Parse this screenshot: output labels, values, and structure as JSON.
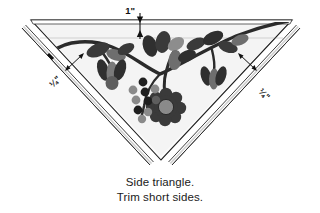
{
  "figure": {
    "name": "side-triangle-applique-diagram",
    "caption_lines": [
      "Side triangle.",
      "Trim short sides."
    ],
    "dimensions": {
      "top_label": "1\"",
      "left_label": "¼\"",
      "right_label": "¼\""
    },
    "colors": {
      "outline": "#1a1a1a",
      "patch_fill": "#f7f7f7",
      "patch_fill_shadow": "#e8e8e8",
      "motif_dark": "#2b2b2b",
      "motif_mid": "#6e6e6e",
      "motif_light": "#9a9a9a",
      "background": "#ffffff",
      "trim_line": "#333333"
    },
    "elements": {
      "triangle_name": "side-triangle-patch",
      "top_band_name": "top-seam-allowance-band",
      "left_trim_name": "left-trim-line",
      "right_trim_name": "right-trim-line",
      "motif_name": "floral-vine-applique",
      "flower_name": "center-flower",
      "berries_name": "berry-cluster"
    }
  }
}
